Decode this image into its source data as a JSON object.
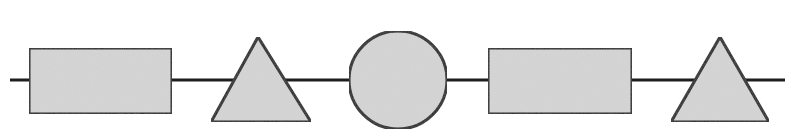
{
  "diagram": {
    "type": "shape-sequence",
    "colors": {
      "fill": "#d6d6d6",
      "stroke": "#1e1e1e",
      "background": "#ffffff"
    },
    "connector": {
      "x1": 10,
      "x2": 785,
      "y": 80
    },
    "shapes": [
      {
        "kind": "rectangle",
        "x": 29,
        "y": 48,
        "w": 143,
        "h": 66
      },
      {
        "kind": "triangle",
        "points": "258,37 211,122 311,122"
      },
      {
        "kind": "circle",
        "cx": 398,
        "cy": 80,
        "r": 49
      },
      {
        "kind": "rectangle",
        "x": 488,
        "y": 48,
        "w": 144,
        "h": 66
      },
      {
        "kind": "triangle",
        "points": "720,37 671,122 769,122"
      }
    ]
  }
}
